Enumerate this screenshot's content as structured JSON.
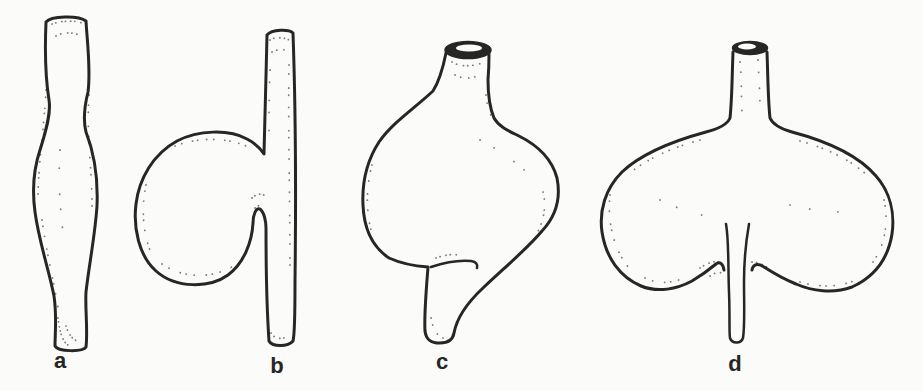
{
  "diagram": {
    "figures": [
      {
        "label": "a"
      },
      {
        "label": "b"
      },
      {
        "label": "c"
      },
      {
        "label": "d"
      }
    ],
    "colors": {
      "ink": "#262626",
      "paper": "#fbfbfa"
    }
  }
}
